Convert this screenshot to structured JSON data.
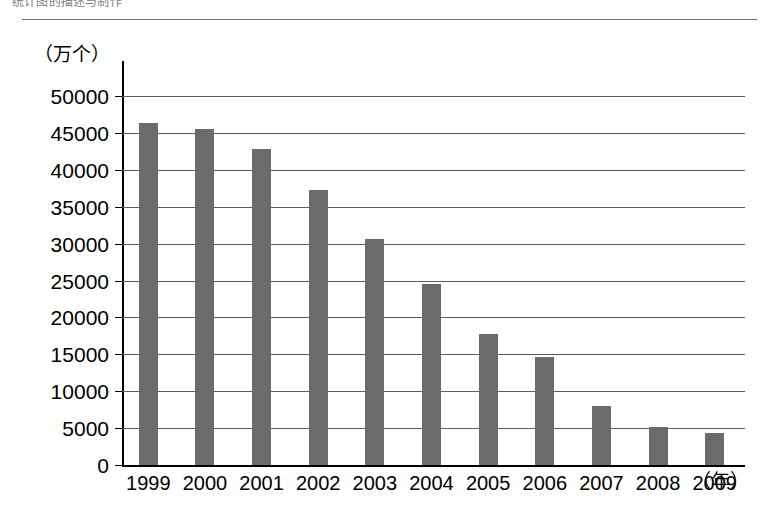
{
  "caption": {
    "text": "统计图的描述与制作"
  },
  "chart_data": {
    "type": "bar",
    "title": "",
    "subtitle": "",
    "xlabel": "（年）",
    "ylabel": "（万个）",
    "unit_y": "（万个）",
    "unit_x": "（年）",
    "categories": [
      "1999",
      "2000",
      "2001",
      "2002",
      "2003",
      "2004",
      "2005",
      "2006",
      "2007",
      "2008",
      "2009"
    ],
    "values": [
      46300,
      45500,
      42800,
      37200,
      30600,
      24500,
      17800,
      14600,
      8000,
      5100,
      4300
    ],
    "series": [
      {
        "name": "数量",
        "values": [
          46300,
          45500,
          42800,
          37200,
          30600,
          24500,
          17800,
          14600,
          8000,
          5100,
          4300
        ]
      }
    ],
    "ylim": [
      0,
      50000
    ],
    "ytick_labels": [
      "50000",
      "45000",
      "40000",
      "35000",
      "30000",
      "25000",
      "20000",
      "15000",
      "10000",
      "5000",
      "0"
    ],
    "ytick_values": [
      50000,
      45000,
      40000,
      35000,
      30000,
      25000,
      20000,
      15000,
      10000,
      5000,
      0
    ],
    "ytick_step": 5000,
    "grid": true,
    "legend": false,
    "legend_position": "none",
    "bar_color": "#6b6b6b",
    "axis_color": "#000000",
    "grid_color": "#5b5b5b",
    "background": "#ffffff"
  }
}
